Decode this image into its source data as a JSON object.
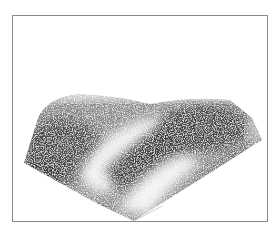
{
  "figure": {
    "colors": {
      "frame": "#8a8a8a",
      "background": "#ffffff",
      "dark_band": "#3a3a3a",
      "light_band": "#e8e8e8"
    }
  }
}
